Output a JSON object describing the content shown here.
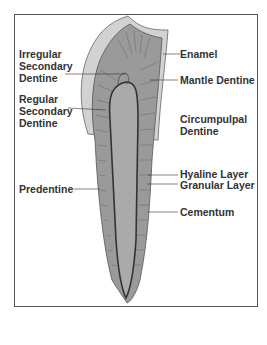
{
  "diagram": {
    "labels_left": [
      {
        "id": "irregular-secondary-dentine",
        "text": "Irregular\nSecondary\nDentine"
      },
      {
        "id": "regular-secondary-dentine",
        "text": "Regular\nSecondary\nDentine"
      },
      {
        "id": "predentine",
        "text": "Predentine"
      }
    ],
    "labels_right": [
      {
        "id": "enamel",
        "text": "Enamel"
      },
      {
        "id": "mantle-dentine",
        "text": "Mantle Dentine"
      },
      {
        "id": "circumpulpal-dentine",
        "text": "Circumpulpal\nDentine"
      },
      {
        "id": "hyaline-layer",
        "text": "Hyaline Layer"
      },
      {
        "id": "granular-layer",
        "text": "Granular Layer"
      },
      {
        "id": "cementum",
        "text": "Cementum"
      }
    ],
    "colors": {
      "enamel": "#d2d2d2",
      "dentine": "#9a9a9a",
      "pulp": "#aaaaaa",
      "outline": "#444444",
      "border": "#555555",
      "text": "#333333"
    }
  }
}
